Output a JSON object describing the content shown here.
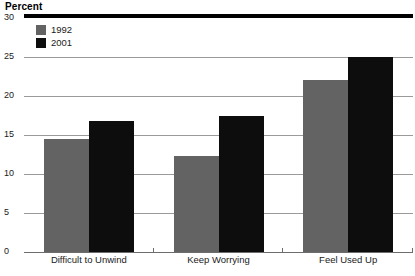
{
  "chart_data": {
    "type": "bar",
    "title": "Percent",
    "xlabel": "",
    "ylabel": "Percent",
    "ylim": [
      0,
      30
    ],
    "yticks": [
      0,
      5,
      10,
      15,
      20,
      25,
      30
    ],
    "ytick_labels": [
      "0",
      "5",
      "10",
      "15",
      "20",
      "25",
      "30"
    ],
    "grid": true,
    "legend_position": "top-left-inside",
    "categories": [
      "Difficult to Unwind",
      "Keep Worrying",
      "Feel Used Up"
    ],
    "series": [
      {
        "name": "1992",
        "color": "#636363",
        "values": [
          14.5,
          12.3,
          22.0
        ]
      },
      {
        "name": "2001",
        "color": "#0d0d0d",
        "values": [
          16.8,
          17.4,
          25.0
        ]
      }
    ]
  },
  "legend": {
    "items": [
      {
        "label": "1992",
        "color": "#636363"
      },
      {
        "label": "2001",
        "color": "#0d0d0d"
      }
    ]
  },
  "caption": {
    "text": ""
  },
  "colors": {
    "series_1992": "#636363",
    "series_2001": "#0d0d0d",
    "gridline": "#9a9a9a",
    "top_rule": "#000000",
    "text": "#1a1a1a"
  }
}
